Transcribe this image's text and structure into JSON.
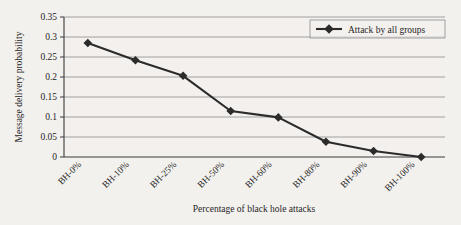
{
  "chart_data": {
    "type": "line",
    "title": "",
    "xlabel": "Percentage of black hole attacks",
    "ylabel": "Message delivery probability",
    "categories": [
      "BH-0%",
      "BH-10%",
      "BH-25%",
      "BH-50%",
      "BH-60%",
      "BH-80%",
      "BH-90%",
      "BH-100%"
    ],
    "series": [
      {
        "name": "Attack by all groups",
        "values": [
          0.285,
          0.242,
          0.203,
          0.115,
          0.099,
          0.038,
          0.015,
          0.0
        ],
        "color": "#2b2b2b",
        "marker": "diamond"
      }
    ],
    "ylim": [
      0,
      0.35
    ],
    "yticks": [
      0,
      0.05,
      0.1,
      0.15,
      0.2,
      0.25,
      0.3,
      0.35
    ],
    "ytick_labels": [
      "0",
      "0.05",
      "0.1",
      "0.15",
      "0.2",
      "0.25",
      "0.3",
      "0.35"
    ],
    "grid": "horizontal",
    "legend_position": "top-right",
    "xtick_rotation": 45
  },
  "legend": {
    "entries": [
      {
        "label": "Attack by all groups",
        "marker_icon": "diamond-marker-icon"
      }
    ]
  },
  "axes": {
    "y_title": "Message delivery probability",
    "x_title": "Percentage of black hole attacks"
  }
}
